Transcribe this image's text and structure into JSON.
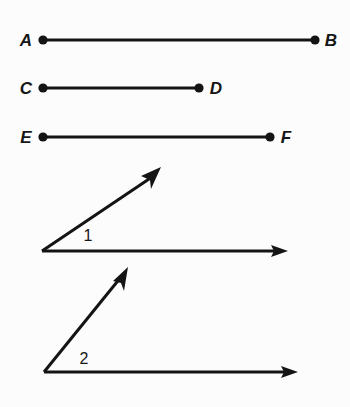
{
  "figure": {
    "background_color": "#fcfcfc",
    "ink_color": "#141414",
    "width": 350,
    "height": 407,
    "segments": [
      {
        "id": "segment-ab",
        "name": "AB",
        "start_label": "A",
        "end_label": "B",
        "start_label_x": 26,
        "start_label_y": 45,
        "end_label_x": 324,
        "end_label_y": 45,
        "x1": 43,
        "y1": 40,
        "x2": 315,
        "y2": 40,
        "length_px": 272
      },
      {
        "id": "segment-cd",
        "name": "CD",
        "start_label": "C",
        "end_label": "D",
        "start_label_x": 26,
        "start_label_y": 94,
        "end_label_x": 208,
        "end_label_y": 94,
        "x1": 43,
        "y1": 88,
        "x2": 199,
        "y2": 88,
        "length_px": 156
      },
      {
        "id": "segment-ef",
        "name": "EF",
        "start_label": "E",
        "end_label": "F",
        "start_label_x": 26,
        "start_label_y": 143,
        "end_label_x": 279,
        "end_label_y": 143,
        "x1": 43,
        "y1": 137,
        "x2": 270,
        "y2": 137,
        "length_px": 227
      }
    ],
    "angles": [
      {
        "id": "angle-1",
        "label": "1",
        "label_x": 84,
        "label_y": 240,
        "vertex_x": 42,
        "vertex_y": 251,
        "horizontal_ray_tip_x": 288,
        "horizontal_ray_tip_y": 251,
        "diagonal_ray_tip_x": 161,
        "diagonal_ray_tip_y": 167
      },
      {
        "id": "angle-2",
        "label": "2",
        "label_x": 79,
        "label_y": 363,
        "vertex_x": 44,
        "vertex_y": 372,
        "horizontal_ray_tip_x": 298,
        "horizontal_ray_tip_y": 372,
        "diagonal_ray_tip_x": 128,
        "diagonal_ray_tip_y": 267
      }
    ]
  }
}
